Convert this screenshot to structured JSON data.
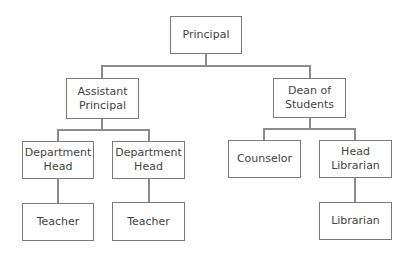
{
  "colors": {
    "box_border": "#7a7a7a",
    "connector": "#8c8c8c",
    "text": "#444444",
    "background": "#ffffff"
  },
  "nodes": {
    "principal": {
      "label": "Principal"
    },
    "assistant_principal": {
      "label": "Assistant\nPrincipal"
    },
    "dean_of_students": {
      "label": "Dean of\nStudents"
    },
    "department_head_1": {
      "label": "Department\nHead"
    },
    "department_head_2": {
      "label": "Department\nHead"
    },
    "counselor": {
      "label": "Counselor"
    },
    "head_librarian": {
      "label": "Head\nLibrarian"
    },
    "teacher_1": {
      "label": "Teacher"
    },
    "teacher_2": {
      "label": "Teacher"
    },
    "librarian": {
      "label": "Librarian"
    }
  },
  "edges": [
    {
      "from": "Principal",
      "to": "Assistant Principal"
    },
    {
      "from": "Principal",
      "to": "Dean of Students"
    },
    {
      "from": "Assistant Principal",
      "to": "Department Head"
    },
    {
      "from": "Assistant Principal",
      "to": "Department Head"
    },
    {
      "from": "Dean of Students",
      "to": "Counselor"
    },
    {
      "from": "Dean of Students",
      "to": "Head Librarian"
    },
    {
      "from": "Department Head",
      "to": "Teacher"
    },
    {
      "from": "Department Head",
      "to": "Teacher"
    },
    {
      "from": "Head Librarian",
      "to": "Librarian"
    }
  ]
}
